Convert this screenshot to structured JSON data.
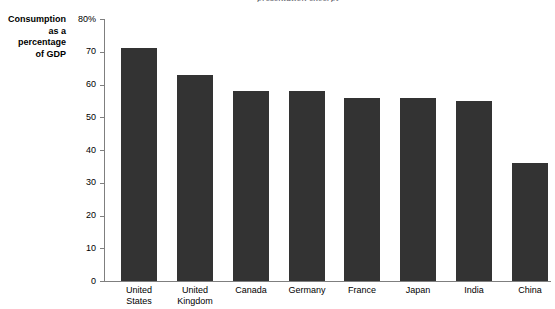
{
  "figure": {
    "top_caption": "presentation excerpt",
    "y_axis_title_lines": [
      "Consumption",
      "as a",
      "percentage",
      "of GDP"
    ],
    "bar_color": "#333333",
    "axis_color": "#7f7f7f",
    "background_color": "#ffffff"
  },
  "chart_data": {
    "type": "bar",
    "title": "",
    "xlabel": "",
    "ylabel": "Consumption as a percentage of GDP",
    "categories": [
      "United States",
      "United Kingdom",
      "Canada",
      "Germany",
      "France",
      "Japan",
      "India",
      "China"
    ],
    "category_lines": [
      [
        "United",
        "States"
      ],
      [
        "United",
        "Kingdom"
      ],
      [
        "Canada",
        ""
      ],
      [
        "Germany",
        ""
      ],
      [
        "France",
        ""
      ],
      [
        "Japan",
        ""
      ],
      [
        "India",
        ""
      ],
      [
        "China",
        ""
      ]
    ],
    "values": [
      71,
      63,
      58,
      58,
      56,
      56,
      55,
      36
    ],
    "ylim": [
      0,
      80
    ],
    "ytick_values": [
      0,
      10,
      20,
      30,
      40,
      50,
      60,
      70,
      80
    ],
    "ytick_labels": [
      "0",
      "10",
      "20",
      "30",
      "40",
      "50",
      "60",
      "70",
      "80%"
    ],
    "grid": false,
    "legend": false,
    "legend_position": "none"
  }
}
